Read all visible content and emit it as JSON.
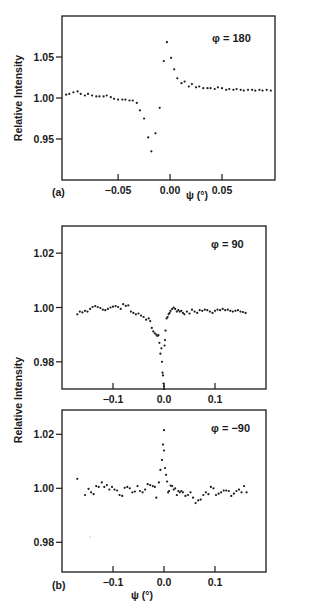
{
  "figure": {
    "ylabel": "Relative Intensity",
    "xlabel": "ψ (°)",
    "panel_a_label": "(a)",
    "panel_b_label": "(b)"
  },
  "chart_data": [
    {
      "type": "scatter",
      "panel": "(a)",
      "annotation": "φ = 180",
      "xlabel": "ψ (°)",
      "ylabel": "Relative Intensity",
      "xlim": [
        -0.104,
        0.101
      ],
      "ylim": [
        0.9,
        1.1
      ],
      "xticks": [
        -0.05,
        0.0,
        0.05
      ],
      "xtick_labels": [
        "−0.05",
        "0.00",
        "0.05"
      ],
      "yticks": [
        0.95,
        1.0,
        1.05
      ],
      "ytick_labels": [
        "0.95",
        "1.00",
        "1.05"
      ],
      "grid": false,
      "frame": {
        "left": 62,
        "right": 275,
        "top": 16,
        "bottom": 180
      },
      "series": [
        {
          "name": "phi=180",
          "x": [
            -0.1,
            -0.097,
            -0.093,
            -0.089,
            -0.086,
            -0.082,
            -0.079,
            -0.075,
            -0.071,
            -0.068,
            -0.064,
            -0.061,
            -0.057,
            -0.054,
            -0.05,
            -0.046,
            -0.043,
            -0.039,
            -0.036,
            -0.032,
            -0.029,
            -0.025,
            -0.021,
            -0.018,
            -0.014,
            -0.01,
            -0.006,
            -0.003,
            0.001,
            0.004,
            0.007,
            0.011,
            0.014,
            0.018,
            0.021,
            0.025,
            0.028,
            0.032,
            0.036,
            0.039,
            0.043,
            0.046,
            0.05,
            0.054,
            0.057,
            0.061,
            0.064,
            0.068,
            0.071,
            0.075,
            0.079,
            0.082,
            0.086,
            0.089,
            0.093,
            0.097
          ],
          "y": [
            1.004,
            1.005,
            1.007,
            1.008,
            1.005,
            1.003,
            1.005,
            1.003,
            1.002,
            1.002,
            1.002,
            1.003,
            1.001,
            0.999,
            0.998,
            0.998,
            0.998,
            0.997,
            0.997,
            0.994,
            0.985,
            0.975,
            0.952,
            0.935,
            0.957,
            0.988,
            1.045,
            1.068,
            1.049,
            1.035,
            1.024,
            1.018,
            1.02,
            1.014,
            1.017,
            1.013,
            1.014,
            1.012,
            1.012,
            1.012,
            1.011,
            1.013,
            1.012,
            1.01,
            1.011,
            1.01,
            1.011,
            1.01,
            1.009,
            1.01,
            1.01,
            1.009,
            1.01,
            1.009,
            1.01,
            1.009
          ]
        }
      ]
    },
    {
      "type": "scatter",
      "panel": "(b) top",
      "annotation": "φ = 90",
      "xlabel": "",
      "ylabel": "Relative Intensity",
      "xlim": [
        -0.2,
        0.2
      ],
      "ylim": [
        0.97,
        1.03
      ],
      "xticks": [
        -0.1,
        0.0,
        0.1
      ],
      "xtick_labels": [
        "−0.1",
        "0.0",
        "0.1"
      ],
      "yticks": [
        0.98,
        1.0,
        1.02
      ],
      "ytick_labels": [
        "0.98",
        "1.00",
        "1.02"
      ],
      "grid": false,
      "frame": {
        "left": 62,
        "right": 266,
        "top": 226,
        "bottom": 389
      },
      "series": [
        {
          "name": "phi=90",
          "x": [
            -0.17,
            -0.165,
            -0.16,
            -0.155,
            -0.15,
            -0.145,
            -0.14,
            -0.135,
            -0.13,
            -0.125,
            -0.12,
            -0.115,
            -0.11,
            -0.105,
            -0.1,
            -0.095,
            -0.09,
            -0.085,
            -0.08,
            -0.075,
            -0.07,
            -0.065,
            -0.06,
            -0.055,
            -0.05,
            -0.045,
            -0.04,
            -0.035,
            -0.03,
            -0.027,
            -0.024,
            -0.021,
            -0.018,
            -0.015,
            -0.013,
            -0.011,
            -0.009,
            -0.007,
            -0.005,
            -0.004,
            -0.003,
            -0.002,
            -0.001,
            0.0,
            0.0,
            0.001,
            0.002,
            0.003,
            0.005,
            0.007,
            0.009,
            0.011,
            0.013,
            0.016,
            0.019,
            0.022,
            0.025,
            0.028,
            0.031,
            0.034,
            0.037,
            0.04,
            0.045,
            0.05,
            0.055,
            0.06,
            0.065,
            0.07,
            0.075,
            0.08,
            0.085,
            0.09,
            0.095,
            0.1,
            0.105,
            0.11,
            0.115,
            0.12,
            0.125,
            0.13,
            0.135,
            0.14,
            0.145,
            0.15,
            0.155,
            0.16
          ],
          "y": [
            0.9975,
            0.9985,
            0.9982,
            0.9988,
            0.9985,
            0.9995,
            1.0002,
            1.0005,
            1.0002,
            0.9998,
            0.9992,
            0.999,
            0.9995,
            1.0,
            1.0003,
            1.0005,
            1.0002,
            0.9995,
            1.0012,
            1.0006,
            1.0008,
            0.9985,
            0.998,
            0.9975,
            0.9978,
            0.997,
            0.9965,
            0.9955,
            0.996,
            0.995,
            0.9925,
            0.9912,
            0.9905,
            0.99,
            0.9895,
            0.9898,
            0.987,
            0.983,
            0.985,
            0.98,
            0.976,
            0.975,
            0.972,
            0.97,
            0.971,
            0.986,
            0.988,
            0.9915,
            0.996,
            0.9965,
            0.9975,
            0.998,
            0.9988,
            0.9995,
            1.0,
            0.9995,
            0.9985,
            0.999,
            0.9985,
            0.9988,
            0.998,
            0.9975,
            0.9985,
            0.9978,
            0.9992,
            0.9985,
            0.998,
            0.999,
            0.9988,
            0.9992,
            0.999,
            0.9985,
            0.998,
            0.9988,
            0.9992,
            0.999,
            0.9995,
            0.999,
            0.9992,
            0.9988,
            0.9985,
            0.9988,
            0.999,
            0.9985,
            0.9983,
            0.998
          ]
        }
      ]
    },
    {
      "type": "scatter",
      "panel": "(b) bottom",
      "annotation": "φ = −90",
      "xlabel": "ψ (°)",
      "ylabel": "Relative Intensity",
      "xlim": [
        -0.2,
        0.2
      ],
      "ylim": [
        0.969,
        1.029
      ],
      "xticks": [
        -0.1,
        0.0,
        0.1
      ],
      "xtick_labels": [
        "−0.1",
        "0.0",
        "0.1"
      ],
      "yticks": [
        0.98,
        1.0,
        1.02
      ],
      "ytick_labels": [
        "0.98",
        "1.00",
        "1.02"
      ],
      "grid": false,
      "frame": {
        "left": 62,
        "right": 266,
        "top": 410,
        "bottom": 572
      },
      "series": [
        {
          "name": "phi=-90",
          "x": [
            -0.17,
            -0.155,
            -0.148,
            -0.143,
            -0.138,
            -0.133,
            -0.128,
            -0.122,
            -0.117,
            -0.112,
            -0.107,
            -0.102,
            -0.097,
            -0.092,
            -0.087,
            -0.082,
            -0.077,
            -0.072,
            -0.067,
            -0.062,
            -0.057,
            -0.052,
            -0.047,
            -0.042,
            -0.037,
            -0.032,
            -0.027,
            -0.022,
            -0.018,
            -0.015,
            -0.01,
            -0.007,
            -0.004,
            -0.002,
            0.0,
            0.0,
            0.002,
            0.004,
            0.006,
            0.008,
            0.01,
            0.013,
            0.016,
            0.019,
            0.022,
            0.025,
            0.028,
            0.031,
            0.034,
            0.037,
            0.042,
            0.047,
            0.052,
            0.057,
            0.062,
            0.067,
            0.072,
            0.077,
            0.082,
            0.087,
            0.092,
            0.097,
            0.102,
            0.107,
            0.112,
            0.117,
            0.122,
            0.127,
            0.132,
            0.137,
            0.142,
            0.147,
            0.152,
            0.157,
            0.162
          ],
          "y": [
            1.0035,
            0.9975,
            0.9998,
            0.9985,
            0.9978,
            1.0008,
            1.0005,
            1.0022,
            1.0005,
            1.0012,
            0.9995,
            1.0005,
            0.9995,
            0.9992,
            0.9975,
            0.9972,
            1.0002,
            1.0005,
            1.0,
            0.9985,
            0.9988,
            1.0008,
            0.999,
            0.9985,
            0.9995,
            1.0015,
            1.0012,
            1.0008,
            1.0005,
            0.9965,
            1.0022,
            1.0068,
            1.0105,
            1.0162,
            1.0215,
            1.014,
            1.0075,
            1.005,
            1.0025,
            0.9985,
            0.999,
            1.001,
            1.0008,
            0.9995,
            1.0,
            0.9975,
            0.999,
            0.9985,
            0.999,
            0.9985,
            0.9972,
            0.9975,
            0.9985,
            0.9965,
            0.9945,
            0.9955,
            0.9958,
            0.9975,
            0.9985,
            0.9978,
            1.0005,
            1.0,
            0.9975,
            0.998,
            0.9985,
            0.9992,
            0.9992,
            0.999,
            0.9972,
            0.998,
            0.999,
            0.9995,
            0.9985,
            1.0008,
            0.9985
          ]
        }
      ],
      "stray_marks": [
        {
          "x": -0.145,
          "y": 0.982
        }
      ]
    }
  ]
}
